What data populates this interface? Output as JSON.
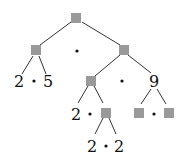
{
  "diagram": {
    "type": "tree",
    "colors": {
      "placeholder_box": "#999999",
      "edge": "#333333",
      "text": "#111111"
    },
    "edges": [
      {
        "x1": 71,
        "y1": 22,
        "x2": 40,
        "y2": 45
      },
      {
        "x1": 82,
        "y1": 22,
        "x2": 120,
        "y2": 45
      },
      {
        "x1": 33,
        "y1": 56,
        "x2": 22,
        "y2": 74
      },
      {
        "x1": 39,
        "y1": 56,
        "x2": 46,
        "y2": 74
      },
      {
        "x1": 120,
        "y1": 55,
        "x2": 95,
        "y2": 76
      },
      {
        "x1": 128,
        "y1": 55,
        "x2": 151,
        "y2": 73
      },
      {
        "x1": 88,
        "y1": 86,
        "x2": 78,
        "y2": 103
      },
      {
        "x1": 94,
        "y1": 86,
        "x2": 103,
        "y2": 103
      },
      {
        "x1": 103,
        "y1": 118,
        "x2": 95,
        "y2": 134
      },
      {
        "x1": 109,
        "y1": 118,
        "x2": 116,
        "y2": 134
      },
      {
        "x1": 151,
        "y1": 89,
        "x2": 141,
        "y2": 104
      },
      {
        "x1": 157,
        "y1": 89,
        "x2": 166,
        "y2": 104
      }
    ],
    "boxes": [
      {
        "name": "root-box",
        "x": 71,
        "y": 13,
        "size": 10
      },
      {
        "name": "left-child-box",
        "x": 31,
        "y": 45,
        "size": 10
      },
      {
        "name": "right-child-box",
        "x": 119,
        "y": 45,
        "size": 10
      },
      {
        "name": "right-left-child-box",
        "x": 86,
        "y": 76,
        "size": 10
      },
      {
        "name": "right-left-right-child-box",
        "x": 101,
        "y": 108,
        "size": 10
      },
      {
        "name": "nine-left-child-box",
        "x": 134,
        "y": 108,
        "size": 10
      },
      {
        "name": "nine-right-child-box",
        "x": 164,
        "y": 108,
        "size": 10
      }
    ],
    "labels": [
      {
        "name": "leaf-2-a",
        "text": "2",
        "x": 19,
        "y": 87
      },
      {
        "name": "leaf-5",
        "text": "5",
        "x": 48,
        "y": 87
      },
      {
        "name": "node-9",
        "text": "9",
        "x": 154,
        "y": 87
      },
      {
        "name": "leaf-2-b",
        "text": "2",
        "x": 76,
        "y": 120
      },
      {
        "name": "leaf-2-c",
        "text": "2",
        "x": 92,
        "y": 152
      },
      {
        "name": "leaf-2-d",
        "text": "2",
        "x": 119,
        "y": 152
      }
    ],
    "dots": [
      {
        "name": "root-dot",
        "x": 77,
        "y": 51
      },
      {
        "name": "left-child-dot",
        "x": 34,
        "y": 81
      },
      {
        "name": "right-child-dot",
        "x": 122,
        "y": 81
      },
      {
        "name": "right-left-child-dot",
        "x": 90,
        "y": 114
      },
      {
        "name": "right-left-right-child-dot",
        "x": 106,
        "y": 146
      },
      {
        "name": "nine-dot",
        "x": 154,
        "y": 114
      }
    ]
  }
}
